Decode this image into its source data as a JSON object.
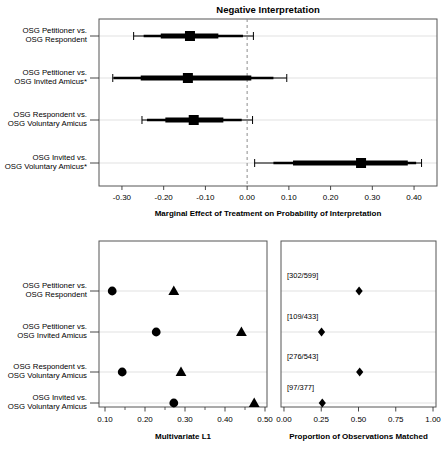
{
  "figure": {
    "title": "Negative Interpretation",
    "colors": {
      "ink": "#000000",
      "grid": "#d9d9d9",
      "frame": "#555555",
      "zero_line": "#8c8c8c"
    }
  },
  "comparisons": [
    {
      "line1": "OSG Petitioner vs.",
      "line2": "OSG Respondent"
    },
    {
      "line1": "OSG Petitioner vs.",
      "line2": "OSG Invited Amicus*"
    },
    {
      "line1": "OSG Respondent vs.",
      "line2": "OSG Voluntary Amicus"
    },
    {
      "line1": "OSG Invited vs.",
      "line2": "OSG Voluntary Amicus*"
    }
  ],
  "comparisons_lower": [
    {
      "line1": "OSG Petitioner vs.",
      "line2": "OSG Respondent"
    },
    {
      "line1": "OSG Petitioner vs.",
      "line2": "OSG Invited Amicus"
    },
    {
      "line1": "OSG Respondent vs.",
      "line2": "OSG Voluntary Amicus"
    },
    {
      "line1": "OSG Invited vs.",
      "line2": "OSG Voluntary Amicus"
    }
  ],
  "chart_data": [
    {
      "id": "marginal-effects-panel",
      "type": "scatter",
      "title": "Negative Interpretation",
      "xlabel": "Marginal Effect of Treatment on Probability of Interpretation",
      "ylabel": "",
      "xlim": [
        -0.355,
        0.455
      ],
      "xticks": [
        -0.3,
        -0.2,
        -0.1,
        0.0,
        0.1,
        0.2,
        0.3,
        0.4
      ],
      "xticklabels": [
        "-0.30",
        "-0.20",
        "-0.10",
        "0.00",
        "0.10",
        "0.20",
        "0.30",
        "0.40"
      ],
      "grid": true,
      "reference_line": 0.0,
      "categories": [
        "OSG Petitioner vs. OSG Respondent",
        "OSG Petitioner vs. OSG Invited Amicus*",
        "OSG Respondent vs. OSG Voluntary Amicus",
        "OSG Invited vs. OSG Voluntary Amicus*"
      ],
      "estimates": [
        -0.137,
        -0.142,
        -0.128,
        0.273
      ],
      "inner_ci": [
        [
          -0.207,
          -0.069
        ],
        [
          -0.255,
          0.01
        ],
        [
          -0.196,
          -0.057
        ],
        [
          0.11,
          0.385
        ]
      ],
      "outer_ci": [
        [
          -0.248,
          -0.01
        ],
        [
          -0.32,
          0.063
        ],
        [
          -0.24,
          -0.013
        ],
        [
          0.063,
          0.405
        ]
      ],
      "whisker_ends": [
        [
          -0.272,
          0.015
        ],
        [
          -0.322,
          0.095
        ],
        [
          -0.252,
          0.013
        ],
        [
          0.018,
          0.418
        ]
      ]
    },
    {
      "id": "multivariate-l1-panel",
      "type": "scatter",
      "title": "",
      "xlabel": "Multivariate L1",
      "xlim": [
        0.085,
        0.505
      ],
      "xticks": [
        0.1,
        0.2,
        0.3,
        0.4,
        0.5
      ],
      "xticklabels": [
        "0.10",
        "0.20",
        "0.30",
        "0.40",
        "0.50"
      ],
      "minor_ticks": [
        0.15,
        0.25,
        0.35,
        0.45
      ],
      "grid": true,
      "categories": [
        "OSG Petitioner vs. OSG Respondent",
        "OSG Petitioner vs. OSG Invited Amicus",
        "OSG Respondent vs. OSG Voluntary Amicus",
        "OSG Invited vs. OSG Voluntary Amicus"
      ],
      "series": [
        {
          "name": "After matching",
          "marker": "circle",
          "values": [
            0.118,
            0.228,
            0.143,
            0.272
          ]
        },
        {
          "name": "Before matching",
          "marker": "triangle",
          "values": [
            0.272,
            0.441,
            0.29,
            0.473
          ]
        }
      ]
    },
    {
      "id": "proportion-matched-panel",
      "type": "scatter",
      "title": "",
      "xlabel": "Proportion of Observations Matched",
      "xlim": [
        -0.02,
        1.02
      ],
      "xticks": [
        0.0,
        0.25,
        0.5,
        0.75,
        1.0
      ],
      "xticklabels": [
        "0.00",
        "0.25",
        "0.50",
        "0.75",
        "1.00"
      ],
      "grid": true,
      "categories": [
        "OSG Petitioner vs. OSG Respondent",
        "OSG Petitioner vs. OSG Invited Amicus",
        "OSG Respondent vs. OSG Voluntary Amicus",
        "OSG Invited vs. OSG Voluntary Amicus"
      ],
      "series": [
        {
          "name": "Proportion matched",
          "marker": "diamond",
          "values": [
            0.504,
            0.252,
            0.508,
            0.257
          ]
        }
      ],
      "annotations": [
        "[302/599]",
        "[109/433]",
        "[276/543]",
        "[97/377]"
      ]
    }
  ]
}
